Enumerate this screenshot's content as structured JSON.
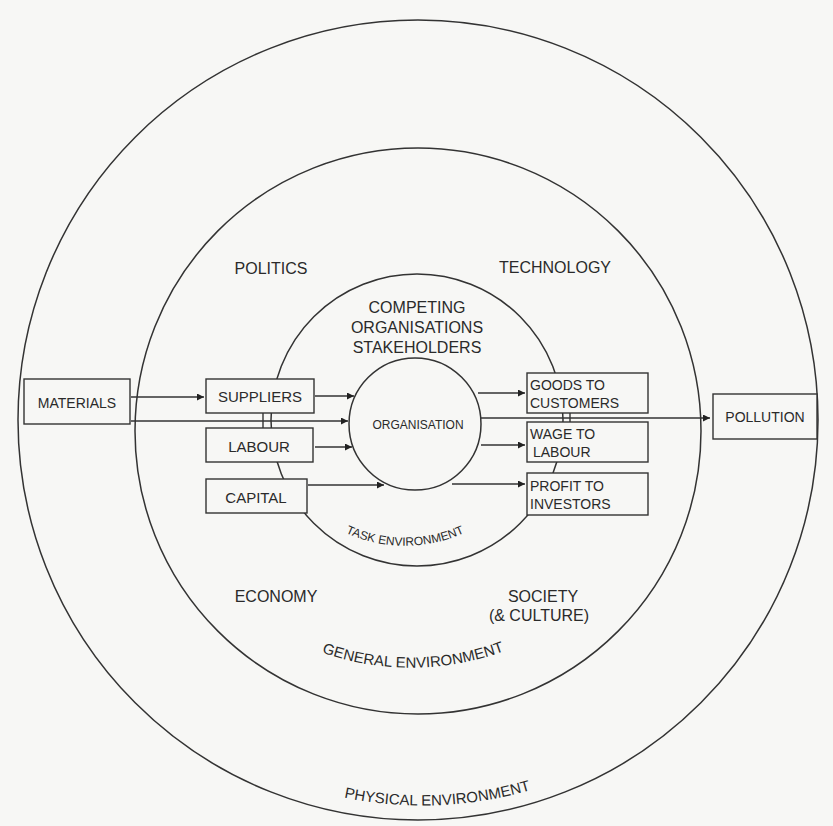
{
  "diagram": {
    "rings": {
      "physical": {
        "label": "PHYSICAL ENVIRONMENT"
      },
      "general": {
        "label": "GENERAL ENVIRONMENT"
      },
      "task": {
        "label": "TASK ENVIRONMENT"
      },
      "organisation": {
        "label": "ORGANISATION"
      }
    },
    "general_factors": {
      "politics": "POLITICS",
      "technology": "TECHNOLOGY",
      "economy": "ECONOMY",
      "society_line1": "SOCIETY",
      "society_line2": "(& CULTURE)"
    },
    "task_factors": {
      "line1": "COMPETING",
      "line2": "ORGANISATIONS",
      "line3": "STAKEHOLDERS"
    },
    "inputs": {
      "materials": "MATERIALS",
      "suppliers": "SUPPLIERS",
      "labour": "LABOUR",
      "capital": "CAPITAL"
    },
    "outputs": {
      "goods_line1": "GOODS TO",
      "goods_line2": "CUSTOMERS",
      "wage_line1": "WAGE TO",
      "wage_line2": "LABOUR",
      "profit_line1": "PROFIT TO",
      "profit_line2": "INVESTORS",
      "pollution": "POLLUTION"
    }
  }
}
